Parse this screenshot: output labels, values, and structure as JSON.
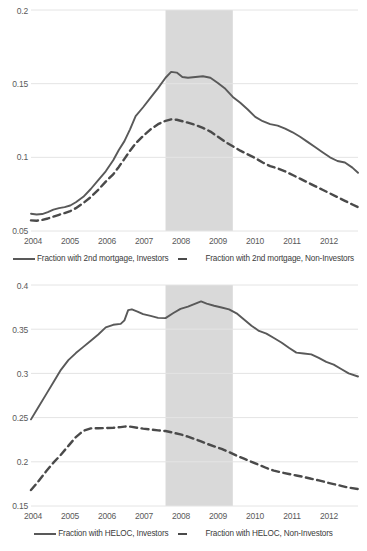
{
  "chart_data": [
    {
      "type": "line",
      "title": "",
      "xlabel": "",
      "ylabel": "",
      "xlim": [
        2004.0,
        2012.75
      ],
      "ylim": [
        0.05,
        0.2
      ],
      "yticks": [
        "0.05",
        "0.1",
        "0.15",
        "0.2"
      ],
      "ytick_values": [
        0.05,
        0.1,
        0.15,
        0.2
      ],
      "xticks": [
        "2004",
        "2005",
        "2006",
        "2007",
        "2008",
        "2009",
        "2010",
        "2011",
        "2012"
      ],
      "xtick_values": [
        2004,
        2005,
        2006,
        2007,
        2008,
        2009,
        2010,
        2011,
        2012
      ],
      "grid": true,
      "legend_position": "bottom",
      "shaded_region": {
        "label": "recession",
        "x_start": 2007.6,
        "x_end": 2009.4,
        "color": "#d9d9d9"
      },
      "x": [
        2004.0,
        2004.15,
        2004.3,
        2004.45,
        2004.6,
        2004.75,
        2004.9,
        2005.05,
        2005.2,
        2005.4,
        2005.6,
        2005.8,
        2006.0,
        2006.2,
        2006.35,
        2006.5,
        2006.65,
        2006.8,
        2007.0,
        2007.2,
        2007.4,
        2007.6,
        2007.75,
        2007.9,
        2008.05,
        2008.2,
        2008.4,
        2008.6,
        2008.8,
        2009.0,
        2009.2,
        2009.4,
        2009.6,
        2009.8,
        2010.0,
        2010.2,
        2010.4,
        2010.6,
        2010.8,
        2011.0,
        2011.2,
        2011.4,
        2011.6,
        2011.8,
        2012.0,
        2012.2,
        2012.4,
        2012.6,
        2012.75
      ],
      "series": [
        {
          "name": "Fraction with 2nd mortgage, Investors",
          "style": "solid",
          "color": "#595959",
          "values": [
            0.0617,
            0.0612,
            0.0615,
            0.0628,
            0.0645,
            0.0655,
            0.0662,
            0.0673,
            0.0695,
            0.0732,
            0.0785,
            0.0845,
            0.0905,
            0.098,
            0.105,
            0.111,
            0.119,
            0.128,
            0.134,
            0.1405,
            0.147,
            0.154,
            0.158,
            0.1575,
            0.1545,
            0.154,
            0.1545,
            0.155,
            0.154,
            0.1505,
            0.1465,
            0.141,
            0.137,
            0.1325,
            0.1275,
            0.1245,
            0.1225,
            0.1215,
            0.1195,
            0.117,
            0.114,
            0.1105,
            0.107,
            0.1035,
            0.1,
            0.0975,
            0.0965,
            0.093,
            0.0895
          ]
        },
        {
          "name": "Fraction with 2nd mortgage, Non-Investors",
          "style": "dashed",
          "color": "#4a4a4a",
          "values": [
            0.0572,
            0.057,
            0.0575,
            0.0585,
            0.0598,
            0.061,
            0.0622,
            0.0635,
            0.0655,
            0.069,
            0.073,
            0.078,
            0.0835,
            0.0885,
            0.0935,
            0.099,
            0.1045,
            0.1095,
            0.1145,
            0.119,
            0.1225,
            0.1248,
            0.1258,
            0.1255,
            0.1245,
            0.1235,
            0.122,
            0.12,
            0.1175,
            0.114,
            0.1105,
            0.1075,
            0.1045,
            0.102,
            0.0995,
            0.0965,
            0.094,
            0.0925,
            0.0905,
            0.088,
            0.0855,
            0.083,
            0.0805,
            0.078,
            0.0755,
            0.073,
            0.0705,
            0.068,
            0.0662
          ]
        }
      ]
    },
    {
      "type": "line",
      "title": "",
      "xlabel": "",
      "ylabel": "",
      "xlim": [
        2004.0,
        2012.75
      ],
      "ylim": [
        0.15,
        0.4
      ],
      "yticks": [
        "0.15",
        "0.2",
        "0.25",
        "0.3",
        "0.35",
        "0.4"
      ],
      "ytick_values": [
        0.15,
        0.2,
        0.25,
        0.3,
        0.35,
        0.4
      ],
      "xticks": [
        "2004",
        "2005",
        "2006",
        "2007",
        "2008",
        "2009",
        "2010",
        "2011",
        "2012"
      ],
      "xtick_values": [
        2004,
        2005,
        2006,
        2007,
        2008,
        2009,
        2010,
        2011,
        2012
      ],
      "grid": true,
      "legend_position": "bottom",
      "shaded_region": {
        "label": "recession",
        "x_start": 2007.6,
        "x_end": 2009.4,
        "color": "#d9d9d9"
      },
      "x": [
        2004.0,
        2004.2,
        2004.4,
        2004.6,
        2004.8,
        2005.0,
        2005.2,
        2005.4,
        2005.6,
        2005.8,
        2006.0,
        2006.2,
        2006.4,
        2006.5,
        2006.6,
        2006.7,
        2006.85,
        2007.0,
        2007.2,
        2007.4,
        2007.6,
        2007.8,
        2008.0,
        2008.2,
        2008.4,
        2008.55,
        2008.7,
        2008.9,
        2009.1,
        2009.3,
        2009.5,
        2009.7,
        2009.9,
        2010.1,
        2010.3,
        2010.5,
        2010.7,
        2010.9,
        2011.1,
        2011.3,
        2011.5,
        2011.7,
        2011.9,
        2012.1,
        2012.3,
        2012.5,
        2012.75
      ],
      "series": [
        {
          "name": "Fraction with HELOC, Investors",
          "style": "solid",
          "color": "#595959",
          "values": [
            0.248,
            0.262,
            0.276,
            0.29,
            0.304,
            0.315,
            0.323,
            0.33,
            0.337,
            0.344,
            0.352,
            0.355,
            0.356,
            0.36,
            0.3715,
            0.3725,
            0.37,
            0.367,
            0.365,
            0.3628,
            0.3625,
            0.368,
            0.373,
            0.3755,
            0.379,
            0.3815,
            0.379,
            0.3765,
            0.3745,
            0.3725,
            0.368,
            0.361,
            0.354,
            0.348,
            0.345,
            0.34,
            0.335,
            0.329,
            0.3235,
            0.3225,
            0.3215,
            0.3175,
            0.313,
            0.31,
            0.305,
            0.3,
            0.2965
          ]
        },
        {
          "name": "Fraction with HELOC, Non-Investors",
          "style": "dashed",
          "color": "#4a4a4a",
          "values": [
            0.168,
            0.178,
            0.189,
            0.199,
            0.208,
            0.218,
            0.228,
            0.235,
            0.2378,
            0.238,
            0.2382,
            0.2385,
            0.2392,
            0.2398,
            0.24,
            0.2395,
            0.2385,
            0.2375,
            0.2365,
            0.2355,
            0.2348,
            0.233,
            0.231,
            0.2285,
            0.2255,
            0.223,
            0.2205,
            0.2175,
            0.2145,
            0.211,
            0.207,
            0.2035,
            0.2,
            0.1965,
            0.193,
            0.19,
            0.188,
            0.1862,
            0.1845,
            0.1828,
            0.1808,
            0.179,
            0.1768,
            0.1748,
            0.1728,
            0.1708,
            0.1692
          ]
        }
      ]
    }
  ],
  "charts": [
    {
      "yticks": [
        "0.2",
        "0.15",
        "0.1",
        "0.05"
      ],
      "xticks": [
        "2004",
        "2005",
        "2006",
        "2007",
        "2008",
        "2009",
        "2010",
        "2011",
        "2012"
      ],
      "legend": {
        "solid_label": "Fraction with 2nd mortgage, Investors",
        "dashed_label": "Fraction with 2nd mortgage, Non-Investors"
      }
    },
    {
      "yticks": [
        "0.4",
        "0.35",
        "0.3",
        "0.25",
        "0.2",
        "0.15"
      ],
      "xticks": [
        "2004",
        "2005",
        "2006",
        "2007",
        "2008",
        "2009",
        "2010",
        "2011",
        "2012"
      ],
      "legend": {
        "solid_label": "Fraction with HELOC, Investors",
        "dashed_label": "Fraction with HELOC, Non-Investors"
      }
    }
  ],
  "colors": {
    "solid_line": "#595959",
    "dashed_line": "#4a4a4a",
    "gridline": "#e4e4e4",
    "shaded_band": "#d9d9d9",
    "tick_text": "#5a5a5a"
  }
}
